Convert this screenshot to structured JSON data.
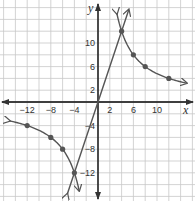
{
  "chart_data": {
    "type": "line",
    "title": "",
    "xlabel": "x",
    "ylabel": "y",
    "xlim": [
      -16,
      16
    ],
    "ylim": [
      -16,
      16
    ],
    "grid": true,
    "grid_step": 2,
    "x_tick_labels": [
      "-12",
      "-8",
      "-4",
      "2",
      "6",
      "10"
    ],
    "x_tick_values": [
      -12,
      -8,
      -4,
      2,
      6,
      10
    ],
    "y_tick_labels": [
      "10",
      "6",
      "2",
      "-4",
      "-8",
      "-12"
    ],
    "y_tick_values": [
      10,
      6,
      2,
      -4,
      -8,
      -12
    ],
    "series": [
      {
        "name": "line y = 3x",
        "kind": "line",
        "x": [
          -5.2,
          5.2
        ],
        "y": [
          -15.6,
          15.6
        ],
        "arrows": true
      },
      {
        "name": "hyperbola y = 48/x (right branch)",
        "kind": "curve",
        "points": [
          [
            3.2,
            15
          ],
          [
            4,
            12
          ],
          [
            6,
            8
          ],
          [
            8,
            6
          ],
          [
            12,
            4
          ],
          [
            15,
            3.2
          ]
        ],
        "marked_points": [
          [
            4,
            12
          ],
          [
            6,
            8
          ],
          [
            8,
            6
          ],
          [
            12,
            4
          ]
        ],
        "arrows": true
      },
      {
        "name": "hyperbola y = 48/x (left branch)",
        "kind": "curve",
        "points": [
          [
            -15,
            -3.2
          ],
          [
            -12,
            -4
          ],
          [
            -8,
            -6
          ],
          [
            -6,
            -8
          ],
          [
            -4,
            -12
          ],
          [
            -3.2,
            -15
          ]
        ],
        "marked_points": [
          [
            -12,
            -4
          ],
          [
            -8,
            -6
          ],
          [
            -6,
            -8
          ],
          [
            -4,
            -12
          ]
        ],
        "arrows": true
      }
    ],
    "colors": {
      "curve": "#555555",
      "grid": "#c8c8c8",
      "axis": "#333333"
    }
  }
}
